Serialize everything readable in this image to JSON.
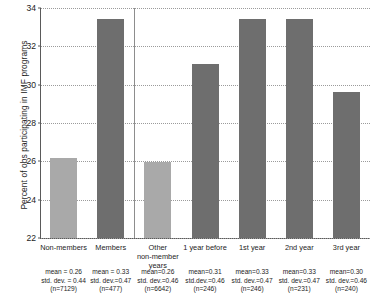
{
  "chart_data": {
    "type": "bar",
    "title": "",
    "xlabel": "",
    "ylabel": "Percent of obs participating in IMF programs",
    "ylim": [
      22,
      34
    ],
    "ytick_labels": [
      "22",
      "24",
      "26",
      "28",
      "30",
      "32",
      "34"
    ],
    "ytick_values": [
      22,
      24,
      26,
      28,
      30,
      32,
      34
    ],
    "grid": true,
    "legend": "none",
    "categories": [
      "Non-members",
      "Members",
      "Other non-member years",
      "1 year before",
      "1st year",
      "2nd year",
      "3rd year"
    ],
    "values": [
      26.2,
      33.45,
      25.95,
      31.1,
      33.45,
      33.45,
      29.6
    ],
    "bar_colors": [
      "#a9a9a9",
      "#6e6e6e",
      "#a9a9a9",
      "#6e6e6e",
      "#6e6e6e",
      "#6e6e6e",
      "#6e6e6e"
    ],
    "annotations": [
      {
        "mean": "mean = 0.26",
        "sd": "std. dev. = 0.44",
        "n": "(n=7129)"
      },
      {
        "mean": "mean = 0.33",
        "sd": "std. dev.=0.47",
        "n": "(n=477)"
      },
      {
        "mean": "mean=0.26",
        "sd": "std. dev.=0.46",
        "n": "(n=6642)"
      },
      {
        "mean": "mean=0.31",
        "sd": "std.dev.=0.46",
        "n": "(n=246)"
      },
      {
        "mean": "mean=0.33",
        "sd": "std. dev.=0.47",
        "n": "(n=246)"
      },
      {
        "mean": "mean=0.33",
        "sd": "std. dev.=0.47",
        "n": "(n=231)"
      },
      {
        "mean": "mean=0.30",
        "sd": "std. dev.=0.46",
        "n": "(n=240)"
      }
    ],
    "xtick_lines": [
      [
        "Non-members"
      ],
      [
        "Members"
      ],
      [
        "Other",
        "non-member",
        "years"
      ],
      [
        "1 year before"
      ],
      [
        "1st year"
      ],
      [
        "2nd year"
      ],
      [
        "3rd year"
      ]
    ],
    "divider_after_category_index": 1,
    "colors": {
      "bar_light": "#a9a9a9",
      "bar_dark": "#6e6e6e",
      "axis": "#5a5a5a",
      "grid": "#9b9b9b",
      "text": "#1d1d1d",
      "background": "#ffffff"
    }
  }
}
